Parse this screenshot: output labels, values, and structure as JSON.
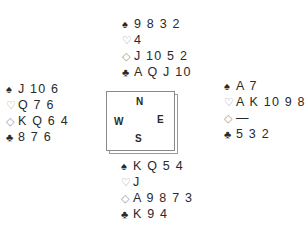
{
  "suits": {
    "spade": "♠",
    "heart": "♡",
    "diamond": "◇",
    "club": "♣"
  },
  "hands": {
    "north": {
      "spades": "9 8 3 2",
      "hearts": "4",
      "diamonds": "J 10 5 2",
      "clubs": "A Q J 10"
    },
    "west": {
      "spades": "J 10 6",
      "hearts": "Q 7 6",
      "diamonds": "K Q 6 4",
      "clubs": "8 7 6"
    },
    "east": {
      "spades": "A 7",
      "hearts": "A K 10 9 8 5 3 2",
      "diamonds": "—",
      "clubs": "5 3 2"
    },
    "south": {
      "spades": "K Q 5 4",
      "hearts": "J",
      "diamonds": "A 9 8 7 3",
      "clubs": "K 9 4"
    }
  },
  "compass": {
    "north": "N",
    "west": "W",
    "east": "E",
    "south": "S"
  },
  "colors": {
    "text": "#2a2a2a",
    "red_suit_outline": "#9a9a9a",
    "box_border": "#8a8a8a"
  }
}
